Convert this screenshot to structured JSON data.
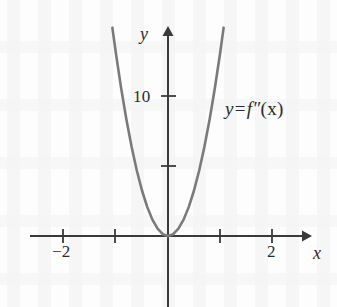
{
  "figure": {
    "background_color": "#fdfdfd",
    "width": 337,
    "height": 307
  },
  "labels": {
    "x_axis_name": "x",
    "y_axis_name": "y",
    "curve_label_y": "y",
    "curve_label_equals": "=",
    "curve_label_fn": "f″",
    "curve_label_arg": "(x)",
    "x_tick_neg2": "−2",
    "x_tick_pos2": "2",
    "y_tick_10": "10"
  },
  "colors": {
    "curve": "#7a7a7a",
    "axis": "#3a3a3a",
    "text": "#2b2b2b",
    "background": "#fdfdfd"
  },
  "chart_data": {
    "type": "line",
    "title": "",
    "subtitle": "",
    "xlabel": "x",
    "ylabel": "y",
    "equation": "y = f″(x)",
    "function_form": "y = 13x^2",
    "xlim": [
      -2.65,
      2.75
    ],
    "ylim": [
      -5.0,
      14.9
    ],
    "grid": false,
    "legend": "none",
    "annotations": [
      {
        "text": "y = f″(x)",
        "x": 1.1,
        "y": 9.2
      }
    ],
    "axes": {
      "x_axis_at_y": 0,
      "y_axis_at_x": 0,
      "x_arrow": "right",
      "y_arrow": "up",
      "x_ticks": [
        -2,
        -1,
        1,
        2
      ],
      "x_tick_labels": [
        "−2",
        "",
        "",
        "2"
      ],
      "y_ticks": [
        5,
        10
      ],
      "y_tick_labels": [
        "",
        "10"
      ]
    },
    "series": [
      {
        "name": "f''(x)",
        "color": "#7a7a7a",
        "x": [
          -1.07,
          -1.0,
          -0.9,
          -0.8,
          -0.7,
          -0.6,
          -0.5,
          -0.4,
          -0.3,
          -0.2,
          -0.1,
          0.0,
          0.1,
          0.2,
          0.3,
          0.4,
          0.5,
          0.6,
          0.7,
          0.8,
          0.9,
          1.0,
          1.07
        ],
        "y": [
          14.88,
          13.0,
          10.53,
          8.32,
          6.37,
          4.68,
          3.25,
          2.08,
          1.17,
          0.52,
          0.13,
          0.0,
          0.13,
          0.52,
          1.17,
          2.08,
          3.25,
          4.68,
          6.37,
          8.32,
          10.53,
          13.0,
          14.88
        ]
      }
    ],
    "key_points": [
      {
        "label": "vertex",
        "x": 0,
        "y": 0
      }
    ]
  }
}
